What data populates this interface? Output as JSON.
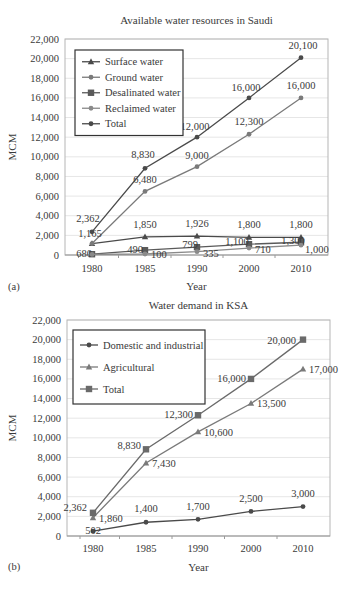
{
  "chart_data": [
    {
      "id": "a",
      "panel_label": "(a)",
      "type": "line",
      "title": "Available water resources in Saudi",
      "xlabel": "Year",
      "ylabel": "MCM",
      "categories": [
        "1980",
        "1985",
        "1990",
        "2000",
        "2010"
      ],
      "ylim": [
        0,
        22000
      ],
      "yticks": [
        0,
        2000,
        4000,
        6000,
        8000,
        10000,
        12000,
        14000,
        16000,
        18000,
        20000,
        22000
      ],
      "ytick_labels": [
        "0",
        "2,000",
        "4,000",
        "6,000",
        "8,000",
        "10,000",
        "12,000",
        "14,000",
        "16,000",
        "18,000",
        "20,000",
        "22,000"
      ],
      "grid": true,
      "legend_position": "upper-left",
      "series": [
        {
          "name": "Surface water",
          "marker": "triangle",
          "values": [
            1165,
            1850,
            1926,
            1800,
            1800
          ],
          "labels": [
            "",
            "1,850",
            "1,926",
            "1,800",
            "1,800"
          ]
        },
        {
          "name": "Ground water",
          "marker": "dot",
          "values": [
            1165,
            6480,
            9000,
            12300,
            16000
          ],
          "labels": [
            "1,165",
            "6,480",
            "9,000",
            "12,300",
            "16,000"
          ]
        },
        {
          "name": "Desalinated water",
          "marker": "square",
          "values": [
            80,
            490,
            795,
            1100,
            1300
          ],
          "labels": [
            "680",
            "490",
            "799",
            "1,100",
            "1,300"
          ]
        },
        {
          "name": "Reclaimed water",
          "marker": "dot",
          "values": [
            60,
            100,
            335,
            710,
            1000
          ],
          "labels": [
            "",
            "100",
            "335",
            "710",
            "1,000"
          ]
        },
        {
          "name": "Total",
          "marker": "dot",
          "values": [
            2362,
            8830,
            12000,
            16000,
            20100
          ],
          "labels": [
            "2,362",
            "8,830",
            "12,000",
            "16,000",
            "20,100"
          ]
        }
      ]
    },
    {
      "id": "b",
      "panel_label": "(b)",
      "type": "line",
      "title": "Water demand in KSA",
      "xlabel": "Year",
      "ylabel": "MCM",
      "categories": [
        "1980",
        "1985",
        "1990",
        "2000",
        "2010"
      ],
      "ylim": [
        0,
        22000
      ],
      "yticks": [
        0,
        2000,
        4000,
        6000,
        8000,
        10000,
        12000,
        14000,
        16000,
        18000,
        20000,
        22000
      ],
      "ytick_labels": [
        "0",
        "2,000",
        "4,000",
        "6,000",
        "8,000",
        "10,000",
        "12,000",
        "14,000",
        "16,000",
        "18,000",
        "20,000",
        "22,000"
      ],
      "grid": true,
      "legend_position": "upper-left",
      "series": [
        {
          "name": "Domestic and industrial",
          "marker": "dot",
          "values": [
            502,
            1400,
            1700,
            2500,
            3000
          ],
          "labels": [
            "502",
            "1,400",
            "1,700",
            "2,500",
            "3,000"
          ]
        },
        {
          "name": "Agricultural",
          "marker": "triangle",
          "values": [
            1860,
            7430,
            10600,
            13500,
            17000
          ],
          "labels": [
            "1,860",
            "7,430",
            "10,600",
            "13,500",
            "17,000"
          ]
        },
        {
          "name": "Total",
          "marker": "square",
          "values": [
            2362,
            8830,
            12300,
            16000,
            20000
          ],
          "labels": [
            "2,362",
            "8,830",
            "12,300",
            "16,000",
            "20,000"
          ]
        }
      ]
    }
  ],
  "colors": {
    "line_dark": "#4a4a4a",
    "line_mid": "#6e6e6e",
    "line_light": "#8a8a8a",
    "grid": "#e6e6e6",
    "axis": "#9a9a9a",
    "text": "#3a3a3a"
  }
}
